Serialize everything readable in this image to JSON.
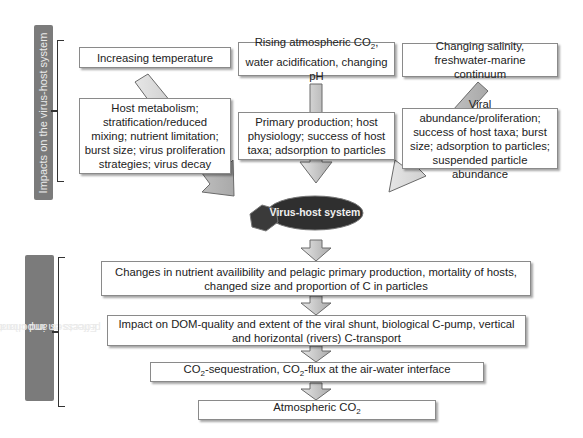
{
  "side_labels": {
    "top": "Impacts on the virus-host system",
    "bottom_line1": "Effects on important global",
    "bottom_line2": "processes and climate"
  },
  "drivers": [
    {
      "text": "Increasing temperature"
    },
    {
      "text_pre": "Rising atmospheric CO",
      "sub": "2",
      "text_post": ", water acidification, changing pH"
    },
    {
      "text": "Changing salinity, freshwater-marine continuum"
    }
  ],
  "impacts": [
    {
      "text": "Host metabolism; stratification/reduced mixing; nutrient limitation; burst size; virus proliferation strategies; virus decay"
    },
    {
      "text": "Primary production; host physiology; success of host taxa; adsorption to particles"
    },
    {
      "text": "Viral abundance/proliferation; success of host taxa; burst size; adsorption to particles; suspended particle abundance"
    }
  ],
  "center": {
    "label": "Virus-host system",
    "fill": "#2f2f2f",
    "hex_fill": "#3a3a3a"
  },
  "effects": [
    {
      "text": "Changes in nutrient availibility and pelagic primary production, mortality of hosts, changed size and proportion of C in particles"
    },
    {
      "text": "Impact on DOM-quality and extent of the viral shunt, biological C-pump, vertical and horizontal (rivers) C-transport"
    },
    {
      "pre": "CO",
      "sub1": "2",
      "mid": "-sequestration, CO",
      "sub2": "2",
      "post": "-flux at the air-water interface"
    },
    {
      "pre": "Atmospheric CO",
      "sub1": "2"
    }
  ],
  "colors": {
    "side_label_bg": "#7b7b7b",
    "arrow_fill": "#c8c8c8",
    "arrow_stroke": "#6a6a6a"
  }
}
